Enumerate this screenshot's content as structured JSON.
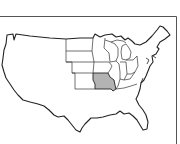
{
  "header": {
    "cutoff_text": ""
  },
  "map": {
    "title": "United States",
    "highlighted_state": "Missouri",
    "highlight_color": "#b3b3b3",
    "outline_color": "#222222",
    "background_color": "#ffffff",
    "states_drawn": [
      "North Dakota",
      "South Dakota",
      "Nebraska",
      "Kansas",
      "Minnesota",
      "Iowa",
      "Missouri",
      "Wisconsin",
      "Illinois",
      "Michigan",
      "Indiana",
      "Ohio"
    ]
  }
}
